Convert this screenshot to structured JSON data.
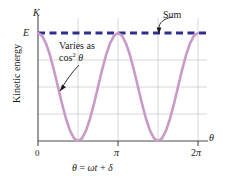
{
  "chart_data": {
    "type": "line",
    "title": "",
    "xlabel": "θ = ωt + δ",
    "ylabel": "Kinetic energy",
    "x_axis_symbol": "θ",
    "y_axis_symbol": "K",
    "xticks": [
      0,
      3.14159,
      6.28319
    ],
    "xticklabels": [
      "0",
      "π",
      "2π"
    ],
    "yticklabels": [
      "E"
    ],
    "ylim": [
      0,
      1.0
    ],
    "xlim": [
      0,
      6.6
    ],
    "grid": true,
    "gridlines_horizontal": [
      0.25,
      0.5,
      0.75
    ],
    "gridlines_vertical": [
      1.5708,
      3.14159,
      4.71239,
      6.28319
    ],
    "legend": "none",
    "series": [
      {
        "name": "Varies as cos² θ",
        "style": "solid",
        "color": "#c89ac8",
        "formula": "E*cos^2(theta)",
        "x": [
          0.0,
          0.1571,
          0.3142,
          0.4712,
          0.6283,
          0.7854,
          0.9425,
          1.0996,
          1.2566,
          1.4137,
          1.5708,
          1.7279,
          1.885,
          2.042,
          2.1991,
          2.3562,
          2.5133,
          2.6704,
          2.8274,
          2.9845,
          3.1416,
          3.2987,
          3.4558,
          3.6128,
          3.7699,
          3.927,
          4.0841,
          4.2412,
          4.3982,
          4.5553,
          4.7124,
          4.8695,
          5.0265,
          5.1836,
          5.3407,
          5.4978,
          5.6549,
          5.8119,
          5.969,
          6.1261,
          6.2832
        ],
        "y": [
          1.0,
          0.9755,
          0.9045,
          0.7939,
          0.6545,
          0.5,
          0.3455,
          0.2061,
          0.0955,
          0.0245,
          0.0,
          0.0245,
          0.0955,
          0.2061,
          0.3455,
          0.5,
          0.6545,
          0.7939,
          0.9045,
          0.9755,
          1.0,
          0.9755,
          0.9045,
          0.7939,
          0.6545,
          0.5,
          0.3455,
          0.2061,
          0.0955,
          0.0245,
          0.0,
          0.0245,
          0.0955,
          0.2061,
          0.3455,
          0.5,
          0.6545,
          0.7939,
          0.9045,
          0.9755,
          1.0
        ],
        "minima_at": [
          1.5708,
          4.71239
        ],
        "maxima_at": [
          0,
          3.14159,
          6.28319
        ]
      },
      {
        "name": "Sum",
        "style": "dashed",
        "color": "#2e2e8f",
        "constant_value": 1.0,
        "x": [
          0,
          6.55
        ],
        "y": [
          1.0,
          1.0
        ]
      }
    ],
    "annotations": [
      {
        "name": "sum-annotation",
        "text": "Sum",
        "target_series": "Sum",
        "arrow": true
      },
      {
        "name": "varies-annotation",
        "text_line1": "Varies as",
        "text_line2_prefix": "cos",
        "text_line2_exponent": "2",
        "text_line2_suffix": "θ",
        "target_series": "Varies as cos² θ",
        "arrow": true
      }
    ]
  },
  "labels": {
    "y_axis_symbol": "K",
    "e_level": "E",
    "x_axis_symbol": "θ",
    "tick_zero": "0",
    "tick_pi": "π",
    "tick_2pi_number": "2",
    "tick_2pi_symbol": "π",
    "y_axis_title": "Kinetic energy",
    "caption": "θ = ωt + δ",
    "caption_theta": "θ",
    "caption_equals": "=",
    "caption_omega_t": "ωt",
    "caption_plus": "+",
    "caption_delta": "δ"
  },
  "annotations": {
    "sum": "Sum",
    "varies_line1": "Varies as",
    "varies_cos": "cos",
    "varies_exponent": "2",
    "varies_theta": "θ"
  },
  "colors": {
    "curve": "#c89ac8",
    "sum_line": "#2e2e8f",
    "grid": "#b9b9c9",
    "axis": "#4a4a4a",
    "text": "#1a1a1a",
    "background": "#ffffff"
  }
}
